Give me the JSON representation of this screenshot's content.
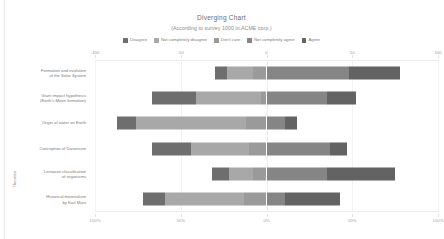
{
  "chart_data": {
    "type": "bar",
    "subtype": "diverging-stacked-bar",
    "title": "Diverging Chart",
    "subtitle": "(According to survey 1000 in ACME corp.)",
    "xlabel": "",
    "ylabel": "Theories",
    "orientation": "horizontal",
    "grid": true,
    "legend_position": "top",
    "xlim": [
      -100,
      100
    ],
    "top_axis_ticks": [
      "-100",
      "-50",
      "0",
      "50",
      "100"
    ],
    "top_axis_values": [
      -100,
      -50,
      0,
      50,
      100
    ],
    "bottom_axis_ticks": [
      "100%",
      "50%",
      "0%",
      "50%",
      "100%"
    ],
    "bottom_axis_values": [
      -100,
      -50,
      0,
      50,
      100
    ],
    "categories": [
      "Formation and evolution of the Solar System",
      "Giant impact hypothesis (Earth's Moon formation)",
      "Origin of water on Earth",
      "Conception of Darwinism",
      "Linnaean classification of organisms",
      "Historical materialism by Karl Marx"
    ],
    "series": [
      {
        "name": "Disagree",
        "color": "#6e6e6e",
        "values": [
          7,
          26,
          11,
          23,
          10,
          13
        ]
      },
      {
        "name": "Not completely disagree",
        "color": "#a8a8a8",
        "values": [
          15,
          38,
          64,
          34,
          14,
          46
        ]
      },
      {
        "name": "Don't care",
        "color": "#9a9a9a",
        "values": [
          8,
          3,
          8,
          10,
          5,
          3
        ]
      },
      {
        "name": "Not completely agree",
        "color": "#858585",
        "values": [
          48,
          35,
          11,
          37,
          35,
          11
        ]
      },
      {
        "name": "Agree",
        "color": "#636363",
        "values": [
          30,
          17,
          7,
          10,
          40,
          32
        ]
      }
    ],
    "bars": [
      {
        "category": "Formation and evolution of the Solar System",
        "segments": [
          {
            "series": "Disagree",
            "start": -30,
            "end": -23
          },
          {
            "series": "Not completely disagree",
            "start": -23,
            "end": -8
          },
          {
            "series": "Don't care",
            "start": -8,
            "end": 0
          },
          {
            "series": "Not completely agree",
            "start": 0,
            "end": 48
          },
          {
            "series": "Agree",
            "start": 48,
            "end": 78
          }
        ]
      },
      {
        "category": "Giant impact hypothesis (Earth's Moon formation)",
        "segments": [
          {
            "series": "Disagree",
            "start": -67,
            "end": -41
          },
          {
            "series": "Not completely disagree",
            "start": -41,
            "end": -3
          },
          {
            "series": "Don't care",
            "start": -3,
            "end": 0
          },
          {
            "series": "Not completely agree",
            "start": 0,
            "end": 35
          },
          {
            "series": "Agree",
            "start": 35,
            "end": 52
          }
        ]
      },
      {
        "category": "Origin of water on Earth",
        "segments": [
          {
            "series": "Disagree",
            "start": -87,
            "end": -76
          },
          {
            "series": "Not completely disagree",
            "start": -76,
            "end": -12
          },
          {
            "series": "Don't care",
            "start": -12,
            "end": 0
          },
          {
            "series": "Not completely agree",
            "start": 0,
            "end": 11
          },
          {
            "series": "Agree",
            "start": 11,
            "end": 18
          }
        ]
      },
      {
        "category": "Conception of Darwinism",
        "segments": [
          {
            "series": "Disagree",
            "start": -67,
            "end": -44
          },
          {
            "series": "Not completely disagree",
            "start": -44,
            "end": -10
          },
          {
            "series": "Don't care",
            "start": -10,
            "end": 0
          },
          {
            "series": "Not completely agree",
            "start": 0,
            "end": 37
          },
          {
            "series": "Agree",
            "start": 37,
            "end": 47
          }
        ]
      },
      {
        "category": "Linnaean classification of organisms",
        "segments": [
          {
            "series": "Disagree",
            "start": -32,
            "end": -22
          },
          {
            "series": "Not completely disagree",
            "start": -22,
            "end": -8
          },
          {
            "series": "Don't care",
            "start": -8,
            "end": 0
          },
          {
            "series": "Not completely agree",
            "start": 0,
            "end": 35
          },
          {
            "series": "Agree",
            "start": 35,
            "end": 75
          }
        ]
      },
      {
        "category": "Historical materialism by Karl Marx",
        "segments": [
          {
            "series": "Disagree",
            "start": -72,
            "end": -59
          },
          {
            "series": "Not completely disagree",
            "start": -59,
            "end": -13
          },
          {
            "series": "Don't care",
            "start": -13,
            "end": 0
          },
          {
            "series": "Not completely agree",
            "start": 0,
            "end": 11
          },
          {
            "series": "Agree",
            "start": 11,
            "end": 43
          }
        ]
      }
    ]
  },
  "chart": {
    "title": "Diverging Chart",
    "subtitle": "(According to survey 1000 in ACME corp.)",
    "y_axis_title": "Theories"
  },
  "legend": {
    "items": [
      {
        "label": "Disagree",
        "color": "#6e6e6e"
      },
      {
        "label": "Not completely disagree",
        "color": "#a8a8a8"
      },
      {
        "label": "Don't care",
        "color": "#9a9a9a"
      },
      {
        "label": "Not completely agree",
        "color": "#858585"
      },
      {
        "label": "Agree",
        "color": "#636363"
      }
    ]
  },
  "y_categories": [
    {
      "lines": [
        "Formation and evolution",
        "of the Solar System"
      ]
    },
    {
      "lines": [
        "Giant impact hypothesis",
        "(Earth's Moon formation)"
      ]
    },
    {
      "lines": [
        "Origin of water on Earth"
      ]
    },
    {
      "lines": [
        "Conception of Darwinism"
      ]
    },
    {
      "lines": [
        "Linnaean classification",
        "of organisms"
      ]
    },
    {
      "lines": [
        "Historical materialism",
        "by Karl Marx"
      ]
    }
  ],
  "axis_top": {
    "ticks": [
      "-100",
      "-50",
      "0",
      "50",
      "100"
    ]
  },
  "axis_bottom": {
    "ticks": [
      "100%",
      "50%",
      "0%",
      "50%",
      "100%"
    ]
  }
}
